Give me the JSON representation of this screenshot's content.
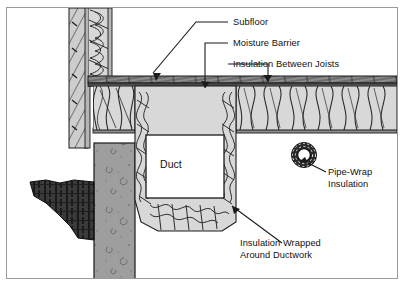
{
  "figure": {
    "kind": "construction-cross-section-diagram",
    "frame_border_color": "#9a9a9a",
    "background_color": "#ffffff"
  },
  "labels": {
    "subfloor": "Subfloor",
    "moisture_barrier": "Moisture Barrier",
    "insulation_between_joists": "Insulation Between Joists",
    "pipe_wrap_line1": "Pipe-Wrap",
    "pipe_wrap_line2": "Insulation",
    "duct": "Duct",
    "insulation_wrapped_line1": "Insulation Wrapped",
    "insulation_wrapped_line2": "Around Ductwork"
  },
  "colors": {
    "line": "#1a1a1a",
    "concrete_fill": "#9e9e9e",
    "soil_fill": "#3a3a3a",
    "insulation_fill": "#d8d8d8",
    "sheathing_fill": "#b5b5b5",
    "subfloor_band": "#6e6e6e",
    "duct_fill": "#ffffff",
    "text": "#111111"
  },
  "components": [
    {
      "name": "exterior-wall-siding",
      "description": "vertical framed wall with diagonal siding hatch at left"
    },
    {
      "name": "wall-cavity-insulation",
      "description": "vertical batt insulation inside wall studs"
    },
    {
      "name": "concrete-foundation-wall",
      "description": "speckled gray concrete wall"
    },
    {
      "name": "soil-grade",
      "description": "dark crosshatched earth at lower left"
    },
    {
      "name": "floor-assembly",
      "description": "subfloor, moisture barrier and joist bays"
    },
    {
      "name": "joist-bay-insulation",
      "description": "batt insulation between floor joists"
    },
    {
      "name": "duct",
      "description": "white rectangular duct in crawlspace"
    },
    {
      "name": "duct-wrap-insulation",
      "description": "insulation wrapped around ductwork"
    },
    {
      "name": "pipe-wrap",
      "description": "annular pipe wrap insulation cross-section"
    }
  ]
}
